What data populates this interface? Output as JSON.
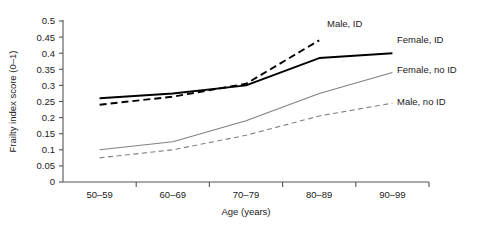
{
  "chart_data": {
    "type": "line",
    "title": "",
    "xlabel": "Age (years)",
    "ylabel": "Frailty index score (0–1)",
    "categories": [
      "50–59",
      "60–69",
      "70–79",
      "80–89",
      "90–99"
    ],
    "ylim": [
      0,
      0.5
    ],
    "yticks": [
      0,
      0.05,
      0.1,
      0.15,
      0.2,
      0.25,
      0.3,
      0.35,
      0.4,
      0.45,
      0.5
    ],
    "ytick_labels": [
      "0",
      "0.05",
      "0.1",
      "0.15",
      "0.2",
      "0.25",
      "0.3",
      "0.35",
      "0.4",
      "0.45",
      "0.5"
    ],
    "grid": false,
    "legend_position": "inline-right",
    "series": [
      {
        "name": "Male, ID",
        "label": "Male, ID",
        "color": "#000000",
        "style": "dashed",
        "width": 1.9,
        "values": [
          0.24,
          0.265,
          0.305,
          0.44,
          null
        ]
      },
      {
        "name": "Female, ID",
        "label": "Female, ID",
        "color": "#000000",
        "style": "solid",
        "width": 1.9,
        "values": [
          0.26,
          0.275,
          0.3,
          0.385,
          0.4
        ]
      },
      {
        "name": "Female, no ID",
        "label": "Female, no ID",
        "color": "#808080",
        "style": "solid",
        "width": 1.1,
        "values": [
          0.1,
          0.125,
          0.19,
          0.275,
          0.34
        ]
      },
      {
        "name": "Male, no ID",
        "label": "Male, no ID",
        "color": "#808080",
        "style": "dashed",
        "width": 1.1,
        "values": [
          0.075,
          0.1,
          0.145,
          0.205,
          0.245
        ]
      }
    ],
    "annotations": [
      {
        "text": "Male, ID",
        "x": 327,
        "y": 27
      },
      {
        "text": "Female, ID",
        "x": 397,
        "y": 43
      },
      {
        "text": "Female, no ID",
        "x": 397,
        "y": 73
      },
      {
        "text": "Male, no ID",
        "x": 397,
        "y": 105
      }
    ]
  },
  "axes": {
    "axis_color": "#555555"
  }
}
